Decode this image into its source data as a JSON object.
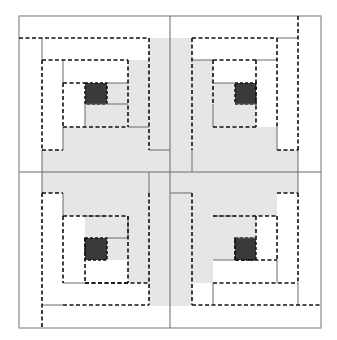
{
  "diagram": {
    "colors": {
      "background": "#ffffff",
      "light_fabric": "#e6e6e6",
      "dark_center": "#3a3a3a",
      "solid_line": "#6a6a6a",
      "dashed_line": "#111111",
      "frame": "#8a8a8a"
    },
    "frame": {
      "x": 19,
      "y": 16,
      "w": 302,
      "h": 312
    },
    "gray_rects": [
      {
        "x": 149,
        "y": 38,
        "w": 43,
        "h": 268
      },
      {
        "x": 42,
        "y": 150,
        "w": 256,
        "h": 43
      },
      {
        "x": 128,
        "y": 60,
        "w": 21,
        "h": 90
      },
      {
        "x": 63,
        "y": 127,
        "w": 86,
        "h": 23
      },
      {
        "x": 107,
        "y": 83,
        "w": 21,
        "h": 44
      },
      {
        "x": 85,
        "y": 104,
        "w": 43,
        "h": 23
      },
      {
        "x": 192,
        "y": 60,
        "w": 21,
        "h": 90
      },
      {
        "x": 192,
        "y": 127,
        "w": 85,
        "h": 23
      },
      {
        "x": 213,
        "y": 83,
        "w": 22,
        "h": 44
      },
      {
        "x": 213,
        "y": 104,
        "w": 43,
        "h": 23
      },
      {
        "x": 63,
        "y": 193,
        "w": 86,
        "h": 23
      },
      {
        "x": 128,
        "y": 193,
        "w": 21,
        "h": 90
      },
      {
        "x": 85,
        "y": 216,
        "w": 43,
        "h": 22
      },
      {
        "x": 107,
        "y": 216,
        "w": 21,
        "h": 44
      },
      {
        "x": 192,
        "y": 193,
        "w": 85,
        "h": 23
      },
      {
        "x": 192,
        "y": 193,
        "w": 21,
        "h": 90
      },
      {
        "x": 213,
        "y": 216,
        "w": 43,
        "h": 22
      },
      {
        "x": 213,
        "y": 216,
        "w": 22,
        "h": 44
      }
    ],
    "dark_squares": [
      {
        "name": "center-square-top-left",
        "x": 85,
        "y": 83,
        "w": 22,
        "h": 21
      },
      {
        "name": "center-square-top-right",
        "x": 235,
        "y": 83,
        "w": 21,
        "h": 21
      },
      {
        "name": "center-square-bottom-left",
        "x": 85,
        "y": 238,
        "w": 22,
        "h": 22
      },
      {
        "name": "center-square-bottom-right",
        "x": 235,
        "y": 238,
        "w": 21,
        "h": 22
      }
    ],
    "solid_lines": [
      [
        170,
        16,
        170,
        328
      ],
      [
        19,
        172,
        321,
        172
      ],
      [
        42,
        38,
        42,
        60
      ],
      [
        63,
        60,
        63,
        83
      ],
      [
        85,
        104,
        85,
        127
      ],
      [
        107,
        83,
        128,
        83
      ],
      [
        85,
        104,
        128,
        104
      ],
      [
        63,
        127,
        63,
        150
      ],
      [
        128,
        127,
        149,
        127
      ],
      [
        149,
        150,
        170,
        150
      ],
      [
        42,
        150,
        42,
        193
      ],
      [
        277,
        38,
        298,
        38
      ],
      [
        256,
        60,
        277,
        60
      ],
      [
        213,
        83,
        235,
        83
      ],
      [
        235,
        104,
        256,
        104
      ],
      [
        213,
        104,
        213,
        127
      ],
      [
        277,
        127,
        277,
        150
      ],
      [
        192,
        60,
        213,
        60
      ],
      [
        192,
        150,
        192,
        172
      ],
      [
        298,
        150,
        298,
        193
      ],
      [
        149,
        172,
        149,
        193
      ],
      [
        63,
        193,
        63,
        216
      ],
      [
        128,
        216,
        128,
        238
      ],
      [
        85,
        216,
        107,
        216
      ],
      [
        107,
        238,
        128,
        238
      ],
      [
        63,
        283,
        85,
        283
      ],
      [
        42,
        305,
        63,
        305
      ],
      [
        170,
        193,
        192,
        193
      ],
      [
        213,
        216,
        235,
        216
      ],
      [
        235,
        238,
        256,
        238
      ],
      [
        277,
        260,
        277,
        283
      ],
      [
        298,
        283,
        298,
        305
      ],
      [
        213,
        260,
        235,
        260
      ],
      [
        213,
        283,
        213,
        305
      ]
    ],
    "dashed_lines": [
      [
        19,
        38,
        149,
        38
      ],
      [
        42,
        60,
        42,
        150
      ],
      [
        42,
        60,
        128,
        60
      ],
      [
        128,
        60,
        128,
        127
      ],
      [
        63,
        83,
        63,
        127
      ],
      [
        63,
        83,
        85,
        83
      ],
      [
        63,
        127,
        128,
        127
      ],
      [
        149,
        38,
        149,
        150
      ],
      [
        42,
        150,
        63,
        150
      ],
      [
        192,
        38,
        277,
        38
      ],
      [
        298,
        16,
        298,
        150
      ],
      [
        277,
        38,
        277,
        127
      ],
      [
        213,
        60,
        256,
        60
      ],
      [
        213,
        60,
        213,
        104
      ],
      [
        256,
        60,
        256,
        127
      ],
      [
        213,
        127,
        256,
        127
      ],
      [
        192,
        38,
        192,
        150
      ],
      [
        277,
        150,
        298,
        150
      ],
      [
        42,
        193,
        42,
        328
      ],
      [
        42,
        193,
        63,
        193
      ],
      [
        63,
        216,
        63,
        283
      ],
      [
        85,
        283,
        149,
        283
      ],
      [
        63,
        305,
        149,
        305
      ],
      [
        149,
        193,
        149,
        305
      ],
      [
        63,
        216,
        128,
        216
      ],
      [
        128,
        216,
        128,
        283
      ],
      [
        85,
        238,
        85,
        283
      ],
      [
        85,
        283,
        128,
        283
      ],
      [
        192,
        193,
        192,
        305
      ],
      [
        192,
        305,
        321,
        305
      ],
      [
        277,
        193,
        298,
        193
      ],
      [
        298,
        193,
        298,
        283
      ],
      [
        213,
        283,
        298,
        283
      ],
      [
        277,
        216,
        277,
        260
      ],
      [
        235,
        260,
        277,
        260
      ],
      [
        213,
        216,
        277,
        216
      ],
      [
        235,
        238,
        235,
        260
      ],
      [
        256,
        216,
        256,
        238
      ]
    ]
  }
}
